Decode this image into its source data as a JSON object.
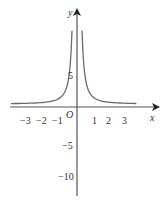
{
  "chart_data": {
    "type": "line",
    "title": "",
    "function": "y = 1/x^2 (graph symmetric about y-axis, asymptotes x=0 and y=0)",
    "xlabel": "x",
    "ylabel": "y",
    "origin_label": "O",
    "x_ticks": [
      {
        "value": -3,
        "label": "−3"
      },
      {
        "value": -2,
        "label": "−2"
      },
      {
        "value": -1,
        "label": "−1"
      },
      {
        "value": 1,
        "label": "1"
      },
      {
        "value": 2,
        "label": "2"
      },
      {
        "value": 3,
        "label": "3"
      }
    ],
    "y_ticks": [
      {
        "value": 5,
        "label": "5"
      },
      {
        "value": -5,
        "label": "−5"
      },
      {
        "value": -10,
        "label": "−10"
      }
    ],
    "xlim": [
      -4.2,
      4.9
    ],
    "ylim": [
      -13,
      14
    ],
    "grid": false,
    "legend": null,
    "series": [
      {
        "name": "left branch",
        "x": [
          -4.0,
          -3.0,
          -2.0,
          -1.5,
          -1.0,
          -0.7,
          -0.5,
          -0.4,
          -0.3
        ],
        "y": [
          0.06,
          0.11,
          0.25,
          0.44,
          1.0,
          2.04,
          4.0,
          6.25,
          11.1
        ]
      },
      {
        "name": "right branch",
        "x": [
          0.3,
          0.4,
          0.5,
          0.7,
          1.0,
          1.5,
          2.0,
          3.0,
          3.6
        ],
        "y": [
          11.1,
          6.25,
          4.0,
          2.04,
          1.0,
          0.44,
          0.25,
          0.11,
          0.08
        ]
      }
    ],
    "colors": {
      "axis": "#555555",
      "curve": "#6a6a6a",
      "text": "#333333"
    }
  }
}
